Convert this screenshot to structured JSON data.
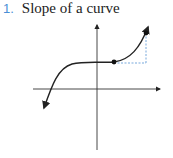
{
  "heading": {
    "number": "1.",
    "title": "Slope of a curve",
    "number_color": "#4a8fd6"
  },
  "figure": {
    "curve_color": "#222222",
    "dashed_color": "#6a9fd8"
  }
}
